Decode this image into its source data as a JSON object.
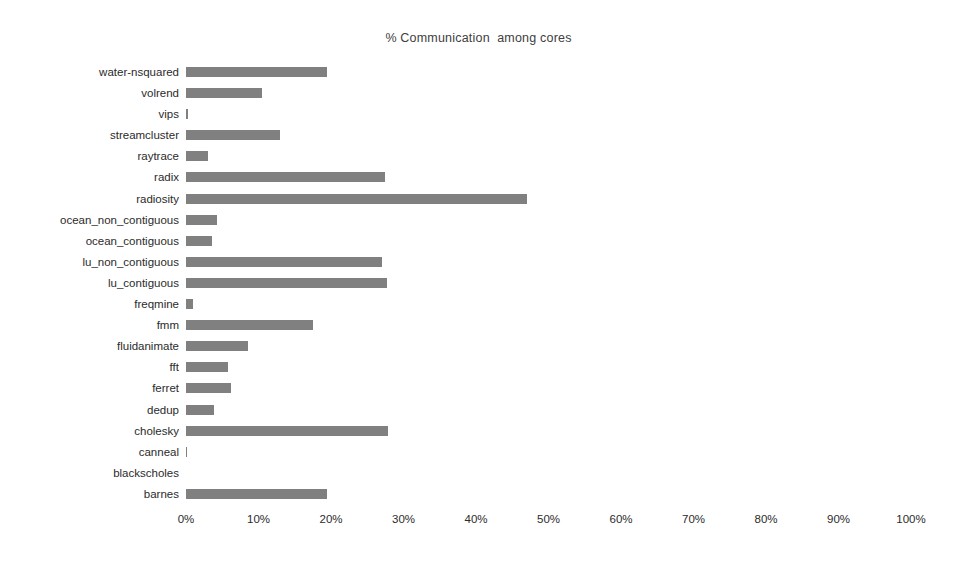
{
  "chart_data": {
    "type": "bar",
    "orientation": "horizontal",
    "title": "% Communication  among cores",
    "xlabel": "",
    "ylabel": "",
    "xlim": [
      0,
      100
    ],
    "xticks": [
      "0%",
      "10%",
      "20%",
      "30%",
      "40%",
      "50%",
      "60%",
      "70%",
      "80%",
      "90%",
      "100%"
    ],
    "xtick_values": [
      0,
      10,
      20,
      30,
      40,
      50,
      60,
      70,
      80,
      90,
      100
    ],
    "grid": false,
    "legend": false,
    "bar_color": "#808080",
    "background_color": "#ffffff",
    "categories": [
      "water-nsquared",
      "volrend",
      "vips",
      "streamcluster",
      "raytrace",
      "radix",
      "radiosity",
      "ocean_non_contiguous",
      "ocean_contiguous",
      "lu_non_contiguous",
      "lu_contiguous",
      "freqmine",
      "fmm",
      "fluidanimate",
      "fft",
      "ferret",
      "dedup",
      "cholesky",
      "canneal",
      "blackscholes",
      "barnes"
    ],
    "values": [
      19.5,
      10.5,
      0.3,
      13.0,
      3.0,
      27.5,
      47.0,
      4.3,
      3.6,
      27.0,
      27.7,
      1.0,
      17.5,
      8.5,
      5.8,
      6.2,
      3.9,
      27.9,
      0.2,
      0.0,
      19.5
    ]
  }
}
